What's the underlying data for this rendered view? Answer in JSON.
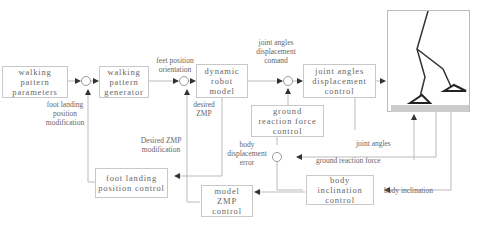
{
  "diagram": {
    "blocks": {
      "walking_pattern_parameters": "walking\npattern\nparameters",
      "walking_pattern_generator": "walking\npattern\ngenerator",
      "dynamic_robot_model": "dynamic\nrobot\nmodel",
      "joint_angles_displacement_control": "joint angles\ndisplacement\ncontrol",
      "ground_reaction_force_control": "ground\nreaction force\ncontrol",
      "body_inclination_control": "body\ninclination\ncontrol",
      "foot_landing_position_control": "foot landing\nposition control",
      "model_zmp_control": "model\nZMP\ncontrol"
    },
    "labels": {
      "feet_position_orientation": "feet position\norientation",
      "joint_angles_displacement_comand": "joint angles\ndisplacement\ncomand",
      "foot_landing_position_modification": "foot landing\nposition\nmodification",
      "desired_zmp": "desired\nZMP",
      "desired_zmp_modification": "Desired ZMP\nmodification",
      "body_displacement_error": "body\ndisplacement\nerror",
      "joint_angles": "joint angles",
      "ground_reaction_force": "ground reaction force",
      "body_inclination": "body inclination"
    },
    "robot_figure": "biped-robot-stick-figure"
  }
}
